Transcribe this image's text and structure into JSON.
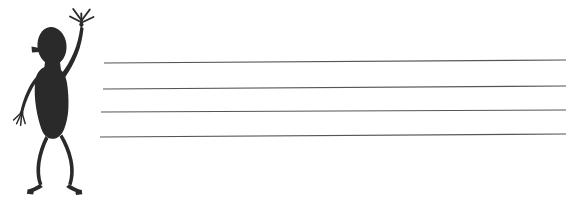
{
  "canvas": {
    "width": 573,
    "height": 201,
    "background_color": "#ffffff",
    "title": "Hand-drawn waving stick figure beside four ruled lines"
  },
  "palette": {
    "ink": "#2b2b2b",
    "figure_fill": "#2a2a2a",
    "rule_line": "#555555",
    "background": "#ffffff"
  },
  "figure": {
    "name": "waving-stick-figure",
    "fill_color": "#2a2a2a",
    "bounds": {
      "x": 10,
      "y": 4,
      "width": 90,
      "height": 194
    },
    "parts": [
      {
        "id": "head",
        "label": "Head",
        "shape": "oval"
      },
      {
        "id": "ear-nub",
        "label": "Ear nub",
        "shape": "small-triangle"
      },
      {
        "id": "torso",
        "label": "Torso",
        "shape": "solid-blob"
      },
      {
        "id": "raised-arm",
        "label": "Raised right arm",
        "shape": "stroke"
      },
      {
        "id": "raised-hand",
        "label": "Raised hand with splayed fingers",
        "fingers": 5
      },
      {
        "id": "lowered-arm",
        "label": "Lowered left arm",
        "shape": "stroke"
      },
      {
        "id": "lowered-hand",
        "label": "Lowered hand with fingers",
        "fingers": 4
      },
      {
        "id": "left-leg",
        "label": "Left leg",
        "shape": "curved-stroke"
      },
      {
        "id": "right-leg",
        "label": "Right leg",
        "shape": "curved-stroke"
      },
      {
        "id": "left-foot",
        "label": "Left foot",
        "shape": "hook"
      },
      {
        "id": "right-foot",
        "label": "Right foot",
        "shape": "hook"
      }
    ]
  },
  "ruled_lines": {
    "name": "ruled-lines-group",
    "count": 4,
    "color": "#555555",
    "thickness": 1.2,
    "lines": [
      {
        "index": 1,
        "x1": 104,
        "y1": 63,
        "x2": 566,
        "y2": 60
      },
      {
        "index": 2,
        "x1": 103,
        "y1": 89,
        "x2": 566,
        "y2": 86
      },
      {
        "index": 3,
        "x1": 101,
        "y1": 112,
        "x2": 566,
        "y2": 110
      },
      {
        "index": 4,
        "x1": 100,
        "y1": 137,
        "x2": 566,
        "y2": 134
      }
    ]
  }
}
